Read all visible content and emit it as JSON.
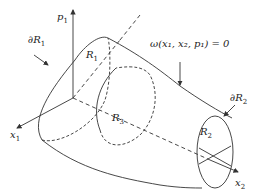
{
  "diagram": {
    "labels": {
      "p1": {
        "base": "p",
        "sub": "1"
      },
      "x1": {
        "base": "x",
        "sub": "1"
      },
      "x2": {
        "base": "x",
        "sub": "2"
      },
      "dR1": {
        "base": "∂R",
        "sub": "1"
      },
      "dR2": {
        "base": "∂R",
        "sub": "2"
      },
      "R1": {
        "base": "R",
        "sub": "1"
      },
      "R2": {
        "base": "R",
        "sub": "2"
      },
      "R3": {
        "base": "R",
        "sub": "3"
      },
      "surface_eq": "ω(x₁, x₂, p₁) = 0"
    },
    "colors": {
      "stroke": "#333333",
      "text": "#222222",
      "background": "#ffffff"
    }
  }
}
